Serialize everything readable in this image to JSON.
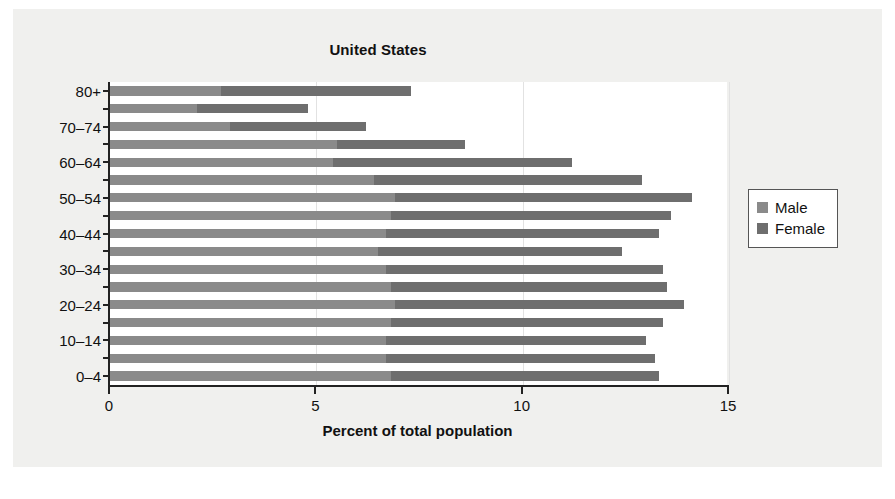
{
  "figure": {
    "background_color": "#f0f0ee",
    "plot_background_color": "#ffffff"
  },
  "legend": {
    "position": "right",
    "entries": [
      {
        "label": "Male",
        "color": "#8a8a8a"
      },
      {
        "label": "Female",
        "color": "#6e6e6e"
      }
    ]
  },
  "chart_data": {
    "type": "bar",
    "orientation": "horizontal",
    "stacked": true,
    "title": "United States",
    "xlabel": "Percent of total population",
    "ylabel": "",
    "xlim": [
      0,
      15
    ],
    "xticks": [
      0,
      5,
      10,
      15
    ],
    "xtick_labels": [
      "0",
      "5",
      "10",
      "15"
    ],
    "grid": true,
    "grid_axis": "x",
    "categories": [
      "0–4",
      "5–9",
      "10–14",
      "15–19",
      "20–24",
      "25–29",
      "30–34",
      "35–39",
      "40–44",
      "45–49",
      "50–54",
      "55–59",
      "60–64",
      "65–69",
      "70–74",
      "75–79",
      "80+"
    ],
    "visible_ytick_labels": [
      "0–4",
      "10–14",
      "20–24",
      "30–34",
      "40–44",
      "50–54",
      "60–64",
      "70–74",
      "80+"
    ],
    "series": [
      {
        "name": "Male",
        "color": "#8a8a8a",
        "values": [
          6.8,
          6.7,
          6.7,
          6.8,
          6.9,
          6.8,
          6.7,
          6.5,
          6.7,
          6.8,
          6.9,
          6.4,
          5.4,
          5.5,
          2.9,
          2.1,
          2.7
        ]
      },
      {
        "name": "Female",
        "color": "#6e6e6e",
        "values": [
          6.5,
          6.5,
          6.3,
          6.6,
          7.0,
          6.7,
          6.7,
          5.9,
          6.6,
          6.8,
          7.2,
          6.5,
          5.8,
          3.1,
          3.3,
          2.7,
          4.6
        ]
      }
    ],
    "totals": [
      13.3,
      13.2,
      13.0,
      13.4,
      13.9,
      13.5,
      13.4,
      12.4,
      13.3,
      13.6,
      14.1,
      12.9,
      11.2,
      8.6,
      6.2,
      4.8,
      7.3
    ]
  }
}
